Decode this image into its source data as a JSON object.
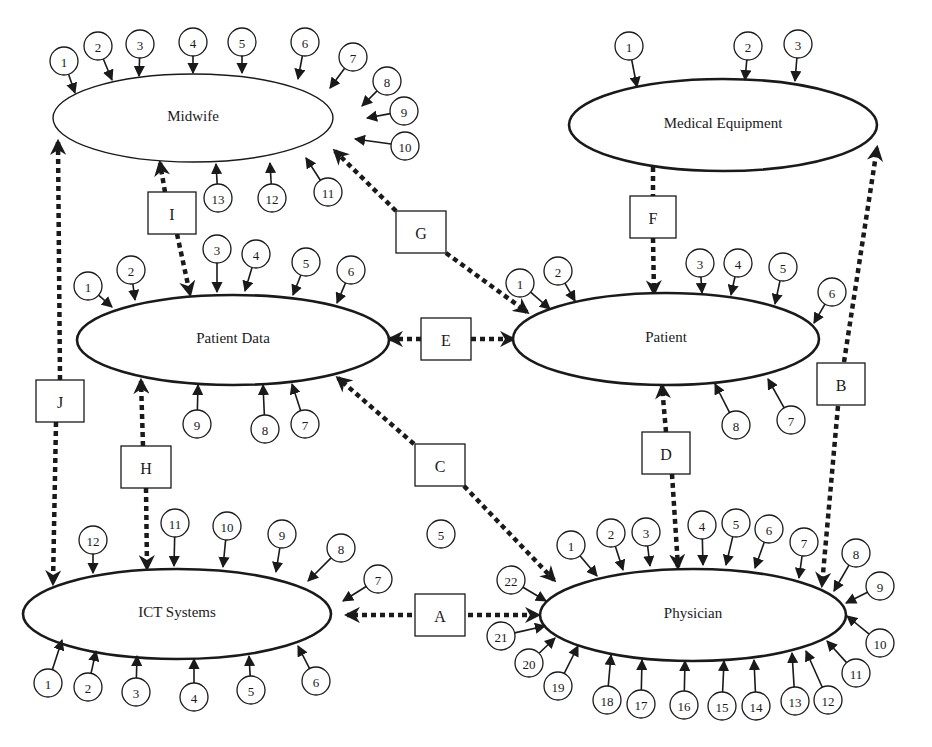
{
  "entities": [
    {
      "id": "midwife",
      "label": "Midwife",
      "cx": 193,
      "cy": 118,
      "rx": 140,
      "ry": 44,
      "thin": true,
      "factors": [
        {
          "n": "1",
          "cx": 64,
          "cy": 61,
          "tx": 75,
          "ty": 93
        },
        {
          "n": "2",
          "cx": 98,
          "cy": 46,
          "tx": 112,
          "ty": 80
        },
        {
          "n": "3",
          "cx": 140,
          "cy": 44,
          "tx": 139,
          "ty": 76
        },
        {
          "n": "4",
          "cx": 193,
          "cy": 42,
          "tx": 193,
          "ty": 73
        },
        {
          "n": "5",
          "cx": 242,
          "cy": 42,
          "tx": 242,
          "ty": 73
        },
        {
          "n": "6",
          "cx": 305,
          "cy": 42,
          "tx": 298,
          "ty": 79
        },
        {
          "n": "7",
          "cx": 353,
          "cy": 57,
          "tx": 330,
          "ty": 88
        },
        {
          "n": "8",
          "cx": 387,
          "cy": 81,
          "tx": 362,
          "ty": 106
        },
        {
          "n": "9",
          "cx": 404,
          "cy": 111,
          "tx": 367,
          "ty": 118
        },
        {
          "n": "10",
          "cx": 405,
          "cy": 146,
          "tx": 355,
          "ty": 139
        },
        {
          "n": "11",
          "cx": 328,
          "cy": 192,
          "tx": 306,
          "ty": 158
        },
        {
          "n": "12",
          "cx": 272,
          "cy": 198,
          "tx": 270,
          "ty": 163
        },
        {
          "n": "13",
          "cx": 218,
          "cy": 198,
          "tx": 216,
          "ty": 164
        }
      ]
    },
    {
      "id": "medical-equipment",
      "label": "Medical Equipment",
      "cx": 723,
      "cy": 125,
      "rx": 154,
      "ry": 46,
      "thin": false,
      "factors": [
        {
          "n": "1",
          "cx": 629,
          "cy": 46,
          "tx": 637,
          "ty": 87
        },
        {
          "n": "2",
          "cx": 748,
          "cy": 46,
          "tx": 745,
          "ty": 80
        },
        {
          "n": "3",
          "cx": 798,
          "cy": 44,
          "tx": 795,
          "ty": 81
        }
      ]
    },
    {
      "id": "patient-data",
      "label": "Patient Data",
      "cx": 233,
      "cy": 340,
      "rx": 156,
      "ry": 45,
      "thin": false,
      "factors": [
        {
          "n": "1",
          "cx": 88,
          "cy": 286,
          "tx": 112,
          "ty": 307
        },
        {
          "n": "2",
          "cx": 131,
          "cy": 270,
          "tx": 135,
          "ty": 300
        },
        {
          "n": "3",
          "cx": 217,
          "cy": 249,
          "tx": 217,
          "ty": 292
        },
        {
          "n": "4",
          "cx": 256,
          "cy": 254,
          "tx": 245,
          "ty": 291
        },
        {
          "n": "5",
          "cx": 306,
          "cy": 262,
          "tx": 293,
          "ty": 295
        },
        {
          "n": "6",
          "cx": 351,
          "cy": 270,
          "tx": 337,
          "ty": 303
        },
        {
          "n": "7",
          "cx": 305,
          "cy": 424,
          "tx": 292,
          "ty": 384
        },
        {
          "n": "8",
          "cx": 265,
          "cy": 429,
          "tx": 263,
          "ty": 385
        },
        {
          "n": "9",
          "cx": 197,
          "cy": 424,
          "tx": 198,
          "ty": 385
        }
      ]
    },
    {
      "id": "patient",
      "label": "Patient",
      "cx": 666,
      "cy": 339,
      "rx": 153,
      "ry": 46,
      "thin": false,
      "factors": [
        {
          "n": "1",
          "cx": 520,
          "cy": 283,
          "tx": 550,
          "ty": 309
        },
        {
          "n": "2",
          "cx": 558,
          "cy": 271,
          "tx": 575,
          "ty": 301
        },
        {
          "n": "3",
          "cx": 700,
          "cy": 263,
          "tx": 702,
          "ty": 293
        },
        {
          "n": "4",
          "cx": 738,
          "cy": 263,
          "tx": 731,
          "ty": 295
        },
        {
          "n": "5",
          "cx": 783,
          "cy": 267,
          "tx": 775,
          "ty": 304
        },
        {
          "n": "6",
          "cx": 832,
          "cy": 292,
          "tx": 814,
          "ty": 323
        },
        {
          "n": "7",
          "cx": 791,
          "cy": 420,
          "tx": 768,
          "ty": 379
        },
        {
          "n": "8",
          "cx": 736,
          "cy": 425,
          "tx": 715,
          "ty": 384
        }
      ]
    },
    {
      "id": "ict-systems",
      "label": "ICT Systems",
      "cx": 177,
      "cy": 614,
      "rx": 154,
      "ry": 45,
      "thin": false,
      "factors": [
        {
          "n": "1",
          "cx": 48,
          "cy": 683,
          "tx": 62,
          "ty": 640
        },
        {
          "n": "2",
          "cx": 88,
          "cy": 687,
          "tx": 96,
          "ty": 651
        },
        {
          "n": "3",
          "cx": 136,
          "cy": 692,
          "tx": 137,
          "ty": 656
        },
        {
          "n": "4",
          "cx": 194,
          "cy": 697,
          "tx": 194,
          "ty": 659
        },
        {
          "n": "5",
          "cx": 251,
          "cy": 690,
          "tx": 249,
          "ty": 656
        },
        {
          "n": "6",
          "cx": 316,
          "cy": 681,
          "tx": 298,
          "ty": 646
        },
        {
          "n": "7",
          "cx": 378,
          "cy": 579,
          "tx": 343,
          "ty": 601
        },
        {
          "n": "8",
          "cx": 341,
          "cy": 548,
          "tx": 308,
          "ty": 581
        },
        {
          "n": "9",
          "cx": 282,
          "cy": 534,
          "tx": 276,
          "ty": 572
        },
        {
          "n": "10",
          "cx": 227,
          "cy": 526,
          "tx": 223,
          "ty": 567
        },
        {
          "n": "11",
          "cx": 175,
          "cy": 523,
          "tx": 174,
          "ty": 566
        },
        {
          "n": "12",
          "cx": 93,
          "cy": 540,
          "tx": 93,
          "ty": 573
        }
      ]
    },
    {
      "id": "physician",
      "label": "Physician",
      "cx": 693,
      "cy": 615,
      "rx": 153,
      "ry": 46,
      "thin": false,
      "factors": [
        {
          "n": "1",
          "cx": 571,
          "cy": 545,
          "tx": 597,
          "ty": 576
        },
        {
          "n": "2",
          "cx": 611,
          "cy": 533,
          "tx": 623,
          "ty": 570
        },
        {
          "n": "3",
          "cx": 646,
          "cy": 532,
          "tx": 650,
          "ty": 566
        },
        {
          "n": "4",
          "cx": 702,
          "cy": 525,
          "tx": 703,
          "ty": 565
        },
        {
          "n": "5",
          "cx": 736,
          "cy": 523,
          "tx": 726,
          "ty": 565
        },
        {
          "n": "6",
          "cx": 769,
          "cy": 529,
          "tx": 755,
          "ty": 568
        },
        {
          "n": "7",
          "cx": 804,
          "cy": 542,
          "tx": 799,
          "ty": 578
        },
        {
          "n": "8",
          "cx": 856,
          "cy": 553,
          "tx": 834,
          "ty": 591
        },
        {
          "n": "9",
          "cx": 880,
          "cy": 586,
          "tx": 846,
          "ty": 603
        },
        {
          "n": "10",
          "cx": 880,
          "cy": 643,
          "tx": 847,
          "ty": 616
        },
        {
          "n": "11",
          "cx": 856,
          "cy": 673,
          "tx": 827,
          "ty": 641
        },
        {
          "n": "12",
          "cx": 828,
          "cy": 700,
          "tx": 806,
          "ty": 651
        },
        {
          "n": "13",
          "cx": 795,
          "cy": 701,
          "tx": 792,
          "ty": 653
        },
        {
          "n": "14",
          "cx": 756,
          "cy": 706,
          "tx": 754,
          "ty": 660
        },
        {
          "n": "15",
          "cx": 722,
          "cy": 706,
          "tx": 724,
          "ty": 661
        },
        {
          "n": "16",
          "cx": 684,
          "cy": 705,
          "tx": 685,
          "ty": 661
        },
        {
          "n": "17",
          "cx": 641,
          "cy": 704,
          "tx": 642,
          "ty": 660
        },
        {
          "n": "18",
          "cx": 607,
          "cy": 700,
          "tx": 611,
          "ty": 655
        },
        {
          "n": "19",
          "cx": 558,
          "cy": 686,
          "tx": 578,
          "ty": 646
        },
        {
          "n": "20",
          "cx": 529,
          "cy": 663,
          "tx": 555,
          "ty": 638
        },
        {
          "n": "21",
          "cx": 501,
          "cy": 636,
          "tx": 545,
          "ty": 626
        },
        {
          "n": "22",
          "cx": 511,
          "cy": 580,
          "tx": 546,
          "ty": 601
        }
      ]
    }
  ],
  "links": [
    {
      "id": "A",
      "label": "A",
      "bx": 440,
      "by": 615,
      "bw": 50,
      "bh": 42,
      "segments": [
        {
          "x1": 412,
          "y1": 615,
          "x2": 347,
          "y2": 615,
          "arrow": true
        },
        {
          "x1": 468,
          "y1": 615,
          "x2": 538,
          "y2": 615,
          "arrow": true
        }
      ]
    },
    {
      "id": "B",
      "label": "B",
      "bx": 841,
      "by": 384,
      "bw": 48,
      "bh": 42,
      "segments": [
        {
          "x1": 844,
          "y1": 362,
          "x2": 877,
          "y2": 148,
          "arrow": true
        },
        {
          "x1": 838,
          "y1": 406,
          "x2": 822,
          "y2": 585,
          "arrow": true
        }
      ]
    },
    {
      "id": "C",
      "label": "C",
      "bx": 440,
      "by": 465,
      "bw": 50,
      "bh": 42,
      "segments": [
        {
          "x1": 414,
          "y1": 444,
          "x2": 338,
          "y2": 378,
          "arrow": true
        },
        {
          "x1": 464,
          "y1": 486,
          "x2": 554,
          "y2": 580,
          "arrow": true
        }
      ]
    },
    {
      "id": "D",
      "label": "D",
      "bx": 666,
      "by": 453,
      "bw": 48,
      "bh": 42,
      "segments": [
        {
          "x1": 666,
          "y1": 432,
          "x2": 662,
          "y2": 386,
          "arrow": true
        },
        {
          "x1": 672,
          "y1": 474,
          "x2": 678,
          "y2": 567,
          "arrow": true
        }
      ]
    },
    {
      "id": "E",
      "label": "E",
      "bx": 446,
      "by": 339,
      "bw": 50,
      "bh": 42,
      "segments": [
        {
          "x1": 421,
          "y1": 339,
          "x2": 390,
          "y2": 339,
          "arrow": true
        },
        {
          "x1": 471,
          "y1": 339,
          "x2": 513,
          "y2": 339,
          "arrow": true
        }
      ]
    },
    {
      "id": "F",
      "label": "F",
      "bx": 653,
      "by": 217,
      "bw": 46,
      "bh": 42,
      "segments": [
        {
          "x1": 653,
          "y1": 167,
          "x2": 653,
          "y2": 196,
          "arrow": false
        },
        {
          "x1": 653,
          "y1": 238,
          "x2": 654,
          "y2": 293,
          "arrow": true
        }
      ]
    },
    {
      "id": "G",
      "label": "G",
      "bx": 421,
      "by": 232,
      "bw": 50,
      "bh": 42,
      "segments": [
        {
          "x1": 396,
          "y1": 211,
          "x2": 335,
          "y2": 151,
          "arrow": true
        },
        {
          "x1": 446,
          "y1": 253,
          "x2": 527,
          "y2": 312,
          "arrow": true
        }
      ]
    },
    {
      "id": "H",
      "label": "H",
      "bx": 146,
      "by": 467,
      "bw": 50,
      "bh": 42,
      "segments": [
        {
          "x1": 143,
          "y1": 446,
          "x2": 141,
          "y2": 381,
          "arrow": true
        },
        {
          "x1": 146,
          "y1": 488,
          "x2": 147,
          "y2": 568,
          "arrow": true
        }
      ]
    },
    {
      "id": "I",
      "label": "I",
      "bx": 172,
      "by": 213,
      "bw": 48,
      "bh": 42,
      "segments": [
        {
          "x1": 165,
          "y1": 192,
          "x2": 160,
          "y2": 163,
          "arrow": true
        },
        {
          "x1": 177,
          "y1": 234,
          "x2": 190,
          "y2": 294,
          "arrow": true
        }
      ]
    },
    {
      "id": "J",
      "label": "J",
      "bx": 60,
      "by": 401,
      "bw": 48,
      "bh": 42,
      "segments": [
        {
          "x1": 60,
          "y1": 380,
          "x2": 58,
          "y2": 142,
          "arrow": true
        },
        {
          "x1": 56,
          "y1": 422,
          "x2": 53,
          "y2": 583,
          "arrow": true
        }
      ]
    }
  ],
  "floating_factors": [
    {
      "n": "5",
      "cx": 441,
      "cy": 534
    }
  ]
}
